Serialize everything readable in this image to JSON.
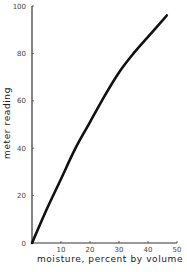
{
  "chart_data": {
    "type": "line",
    "title": "",
    "xlabel": "moisture, percent by volume",
    "ylabel": "meter reading",
    "xlim": [
      0,
      50
    ],
    "ylim": [
      0,
      100
    ],
    "xticks": [
      0,
      10,
      20,
      30,
      40,
      50
    ],
    "yticks": [
      0,
      20,
      40,
      60,
      80,
      100
    ],
    "x_tick_labels": [
      "10",
      "20",
      "30",
      "40",
      "50"
    ],
    "y_tick_labels": [
      "0",
      "20",
      "40",
      "60",
      "80",
      "100"
    ],
    "grid": false,
    "legend": null,
    "series": [
      {
        "name": "meter reading",
        "x": [
          0,
          5,
          10,
          15,
          20,
          25,
          30,
          35,
          40,
          46.5
        ],
        "y": [
          0,
          14,
          27,
          40,
          51,
          62,
          72,
          80,
          87,
          96
        ]
      }
    ]
  }
}
